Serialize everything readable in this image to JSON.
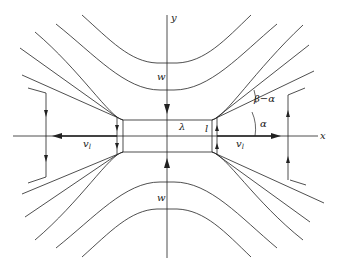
{
  "figure": {
    "type": "flow-field diagram",
    "labels": {
      "x_axis": "x",
      "y_axis": "y",
      "w_top": "w",
      "w_bottom": "w",
      "lambda": "λ",
      "l": "l",
      "v_left": "v",
      "v_left_sub": "l",
      "v_right": "v",
      "v_right_sub": "l",
      "alpha": "α",
      "beta_minus_alpha": "β−α"
    },
    "caption": ""
  },
  "colors": {
    "line": "#222222",
    "background": "#ffffff"
  }
}
